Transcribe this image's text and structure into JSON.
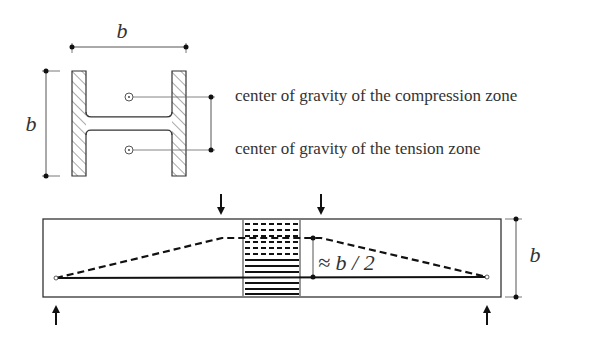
{
  "section": {
    "width_label": "b",
    "height_label": "b"
  },
  "annotations": {
    "compression": "center of gravity of the compression zone",
    "tension": "center of gravity of the tension zone"
  },
  "beam": {
    "height_label": "b",
    "lever_arm_label": "≈ b / 2"
  },
  "colors": {
    "line": "#222222",
    "thin": "#555555",
    "text": "#333333"
  }
}
